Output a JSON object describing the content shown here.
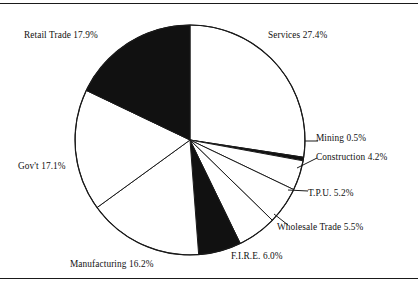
{
  "chart_data": {
    "type": "pie",
    "title": "",
    "subtitle": "",
    "xlabel": "",
    "ylabel": "",
    "legend_position": "none",
    "grid": false,
    "start_angle_deg": 0,
    "direction": "clockwise",
    "units": "percent",
    "total": 100.0,
    "categories": [
      "Services",
      "Mining",
      "Construction",
      "T.P.U.",
      "Wholesale Trade",
      "F.I.R.E.",
      "Manufacturing",
      "Gov't",
      "Retail Trade"
    ],
    "values": [
      27.4,
      0.5,
      4.2,
      5.2,
      5.5,
      6.0,
      16.2,
      17.1,
      17.9
    ],
    "slice_fills": [
      "#ffffff",
      "#111111",
      "#ffffff",
      "#ffffff",
      "#ffffff",
      "#111111",
      "#ffffff",
      "#ffffff",
      "#111111"
    ],
    "slices": [
      {
        "label": "Services",
        "value": 27.4,
        "text": "Services 27.4%",
        "fill": "#ffffff"
      },
      {
        "label": "Mining",
        "value": 0.5,
        "text": "Mining 0.5%",
        "fill": "#111111"
      },
      {
        "label": "Construction",
        "value": 4.2,
        "text": "Construction 4.2%",
        "fill": "#ffffff"
      },
      {
        "label": "T.P.U.",
        "value": 5.2,
        "text": "T.P.U. 5.2%",
        "fill": "#ffffff"
      },
      {
        "label": "Wholesale Trade",
        "value": 5.5,
        "text": "Wholesale Trade 5.5%",
        "fill": "#ffffff"
      },
      {
        "label": "F.I.R.E.",
        "value": 6.0,
        "text": "F.I.R.E. 6.0%",
        "fill": "#111111"
      },
      {
        "label": "Manufacturing",
        "value": 16.2,
        "text": "Manufacturing 16.2%",
        "fill": "#ffffff"
      },
      {
        "label": "Gov't",
        "value": 17.1,
        "text": "Gov't 17.1%",
        "fill": "#ffffff"
      },
      {
        "label": "Retail Trade",
        "value": 17.9,
        "text": "Retail Trade 17.9%",
        "fill": "#111111"
      }
    ]
  },
  "labels": {
    "services": "Services 27.4%",
    "mining": "Mining 0.5%",
    "construction": "Construction 4.2%",
    "tpu": "T.P.U. 5.2%",
    "wholesale": "Wholesale Trade 5.5%",
    "fire": "F.I.R.E. 6.0%",
    "manufacturing": "Manufacturing 16.2%",
    "govt": "Gov't 17.1%",
    "retail": "Retail Trade 17.9%"
  },
  "style": {
    "stroke": "#1a1a1a",
    "background": "#ffffff",
    "fill_dark": "#111111",
    "fill_light": "#ffffff"
  },
  "geometry": {
    "center_x": 190,
    "center_y": 140,
    "radius": 115
  }
}
